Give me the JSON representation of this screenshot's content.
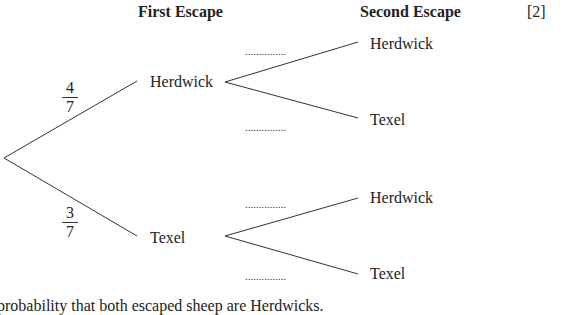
{
  "headers": {
    "first_escape": "First Escape",
    "second_escape": "Second Escape",
    "marks": "[2]"
  },
  "tree": {
    "first_branches": [
      {
        "label": "Herdwick",
        "probability": {
          "numerator": "4",
          "denominator": "7"
        }
      },
      {
        "label": "Texel",
        "probability": {
          "numerator": "3",
          "denominator": "7"
        }
      }
    ],
    "second_branches": {
      "after_herdwick": [
        {
          "label": "Herdwick",
          "answer_blank": "..............."
        },
        {
          "label": "Texel",
          "answer_blank": "..............."
        }
      ],
      "after_texel": [
        {
          "label": "Herdwick",
          "answer_blank": "..............."
        },
        {
          "label": "Texel",
          "answer_blank": "..............."
        }
      ]
    }
  },
  "footer_text": "probability that both escaped sheep are Herdwicks."
}
